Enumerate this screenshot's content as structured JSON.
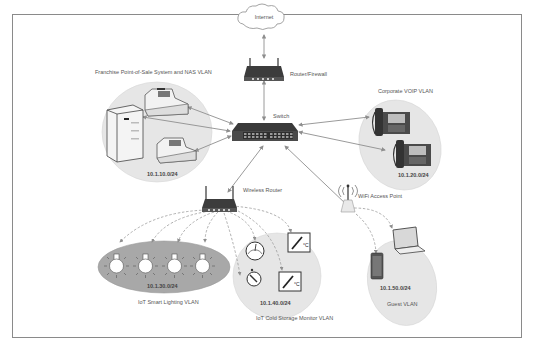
{
  "diagram": {
    "nodes": {
      "internet": "Internet",
      "router_firewall": "Router/Firewall",
      "switch": "Switch",
      "wireless_router": "Wireless Router",
      "wifi_ap": "WiFi Access Point"
    },
    "vlans": [
      {
        "id": "pos",
        "title": "Franchise Point-of-Sale System and NAS VLAN",
        "subnet": "10.1.10.0/24"
      },
      {
        "id": "voip",
        "title": "Corporate VOIP VLAN",
        "subnet": "10.1.20.0/24"
      },
      {
        "id": "lighting",
        "title": "IoT Smart Lighting VLAN",
        "subnet": "10.1.30.0/24"
      },
      {
        "id": "cold",
        "title": "IoT Cold Storage Monitor VLAN",
        "subnet": "10.1.40.0/24"
      },
      {
        "id": "guest",
        "title": "Guest  VLAN",
        "subnet": "10.1.50.0/24"
      }
    ],
    "colors": {
      "vlan_fill": "#e6e6e6",
      "lighting_fill": "#a8a8a8",
      "device_dark": "#3c3c3c",
      "connector": "#8e8e8e",
      "frame_border": "#8a8a8a"
    }
  }
}
